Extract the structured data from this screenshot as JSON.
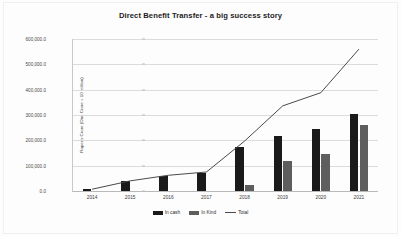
{
  "chart_data": {
    "type": "bar",
    "title": "Direct Benefit Transfer - a big success story",
    "xlabel": "",
    "ylabel": "Rupees Crore (One Crore = 10 million)",
    "categories": [
      "2014",
      "2015",
      "2016",
      "2017",
      "2018",
      "2019",
      "2020",
      "2021"
    ],
    "ylim": [
      0,
      600000
    ],
    "yticks": [
      0,
      100000,
      200000,
      300000,
      400000,
      500000,
      600000
    ],
    "ytick_labels": [
      "0.0",
      "100,000.0",
      "200,000.0",
      "300,000.0",
      "400,000.0",
      "500,000.0",
      "600,000.0"
    ],
    "grid": true,
    "legend_position": "bottom",
    "series": [
      {
        "name": "In cash",
        "type": "bar",
        "color": "#1a1a1a",
        "values": [
          7000,
          38000,
          61000,
          73000,
          175000,
          218000,
          243000,
          305000
        ]
      },
      {
        "name": "In Kind",
        "type": "bar",
        "color": "#5e5e5e",
        "values": [
          0,
          0,
          0,
          0,
          22000,
          118000,
          145000,
          260000
        ]
      },
      {
        "name": "Total",
        "type": "line",
        "color": "#4a4a4a",
        "values": [
          7000,
          40000,
          62000,
          75000,
          197000,
          336000,
          388000,
          560000
        ]
      }
    ]
  },
  "legend": {
    "items": [
      {
        "label": "In cash",
        "marker": "bar-swatch-dark"
      },
      {
        "label": "In Kind",
        "marker": "bar-swatch-gray"
      },
      {
        "label": "Total",
        "marker": "line-swatch"
      }
    ]
  }
}
